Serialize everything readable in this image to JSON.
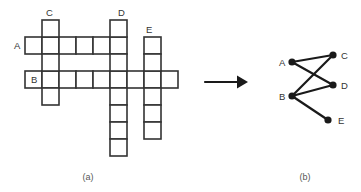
{
  "figure": {
    "panels": [
      {
        "id": "a",
        "caption": "(a)",
        "caption_x": 88,
        "caption_y": 180,
        "type": "crossword-grid"
      },
      {
        "id": "b",
        "caption": "(b)",
        "caption_x": 305,
        "caption_y": 180,
        "type": "graph"
      }
    ],
    "cell_size": 17,
    "stroke_color": "#333333",
    "node_color": "#1a1a1a",
    "arrow": {
      "x1": 205,
      "y1": 82,
      "x2": 248,
      "y2": 82,
      "label": "transforms-to"
    },
    "crossword": {
      "labels": [
        {
          "text": "A",
          "x": 14,
          "y": 49,
          "name": "grid-label-a"
        },
        {
          "text": "B",
          "x": 31,
          "y": 83,
          "name": "grid-label-b"
        },
        {
          "text": "C",
          "x": 46,
          "y": 16,
          "name": "grid-label-c"
        },
        {
          "text": "D",
          "x": 118,
          "y": 16,
          "name": "grid-label-d"
        },
        {
          "text": "E",
          "x": 146,
          "y": 33,
          "name": "grid-label-e"
        }
      ],
      "words": [
        {
          "id": "A",
          "orientation": "horizontal",
          "col": 0,
          "row": 1,
          "length": 6
        },
        {
          "id": "B",
          "orientation": "horizontal",
          "col": 0,
          "row": 3,
          "length": 9
        },
        {
          "id": "C",
          "orientation": "vertical",
          "col": 1,
          "row": 0,
          "length": 5
        },
        {
          "id": "D",
          "orientation": "vertical",
          "col": 5,
          "row": 0,
          "length": 8
        },
        {
          "id": "E",
          "orientation": "vertical",
          "col": 7,
          "row": 1,
          "length": 6
        }
      ],
      "origin": {
        "x": 25,
        "y": 20
      }
    },
    "graph": {
      "nodes": [
        {
          "id": "A",
          "x": 292,
          "y": 62,
          "label_x": 279,
          "label_y": 66,
          "name": "graph-node-a"
        },
        {
          "id": "B",
          "x": 292,
          "y": 96,
          "label_x": 279,
          "label_y": 100,
          "name": "graph-node-b"
        },
        {
          "id": "C",
          "x": 333,
          "y": 55,
          "label_x": 341,
          "label_y": 59,
          "name": "graph-node-c"
        },
        {
          "id": "D",
          "x": 333,
          "y": 85,
          "label_x": 341,
          "label_y": 89,
          "name": "graph-node-d"
        },
        {
          "id": "E",
          "x": 328,
          "y": 120,
          "label_x": 338,
          "label_y": 124,
          "name": "graph-node-e"
        }
      ],
      "edges": [
        {
          "from": "A",
          "to": "C"
        },
        {
          "from": "A",
          "to": "D"
        },
        {
          "from": "B",
          "to": "C"
        },
        {
          "from": "B",
          "to": "D"
        },
        {
          "from": "B",
          "to": "E"
        }
      ],
      "node_radius": 3.6
    }
  }
}
